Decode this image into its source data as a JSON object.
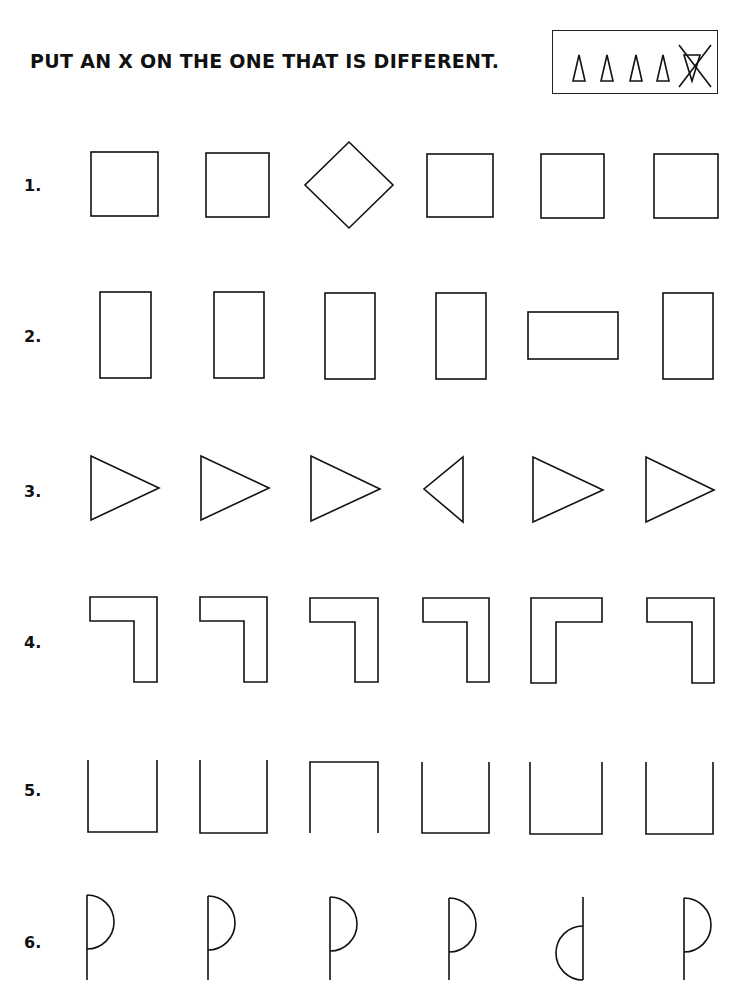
{
  "worksheet": {
    "instruction": "PUT AN X ON THE ONE THAT IS DIFFERENT.",
    "example": {
      "items": [
        "triangle",
        "triangle",
        "triangle",
        "triangle",
        "inverted-triangle-crossed-out"
      ]
    },
    "rows": [
      {
        "number": "1.",
        "shapes": [
          "square",
          "square",
          "diamond",
          "square",
          "square",
          "square"
        ]
      },
      {
        "number": "2.",
        "shapes": [
          "tall-rectangle",
          "tall-rectangle",
          "tall-rectangle",
          "tall-rectangle",
          "wide-rectangle",
          "tall-rectangle"
        ]
      },
      {
        "number": "3.",
        "shapes": [
          "triangle-right",
          "triangle-right",
          "triangle-right",
          "triangle-left",
          "triangle-right",
          "triangle-right"
        ]
      },
      {
        "number": "4.",
        "shapes": [
          "seven-shape",
          "seven-shape",
          "seven-shape",
          "seven-shape",
          "gamma-shape",
          "seven-shape"
        ]
      },
      {
        "number": "5.",
        "shapes": [
          "cup-open-top",
          "cup-open-top",
          "cup-open-bottom",
          "cup-open-top",
          "cup-open-top",
          "cup-open-top"
        ]
      },
      {
        "number": "6.",
        "shapes": [
          "p-shape",
          "p-shape",
          "p-shape",
          "p-shape",
          "mirrored-d-shape",
          "p-shape"
        ]
      }
    ]
  }
}
